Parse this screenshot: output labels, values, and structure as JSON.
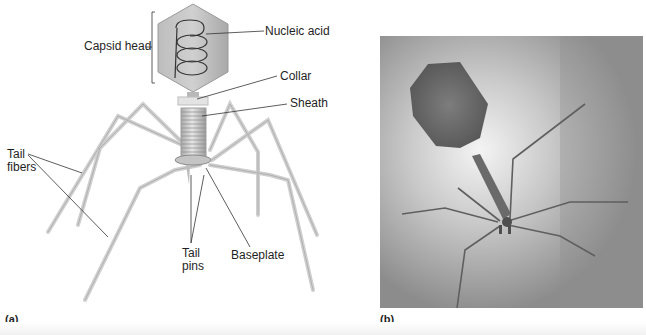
{
  "figure": {
    "panel_a": {
      "letter": "(a)",
      "labels": {
        "capsid_head": "Capsid head",
        "nucleic_acid": "Nucleic acid",
        "collar": "Collar",
        "sheath": "Sheath",
        "tail_fibers_line1": "Tail",
        "tail_fibers_line2": "fibers",
        "tail_pins_line1": "Tail",
        "tail_pins_line2": "pins",
        "baseplate": "Baseplate"
      }
    },
    "panel_b": {
      "letter": "(b)"
    },
    "colors": {
      "capsid_fill": "#b3b3b3",
      "fiber": "#c9c9c9",
      "text": "#1f1f1f",
      "photo_bg": "#9a9a9a"
    }
  }
}
